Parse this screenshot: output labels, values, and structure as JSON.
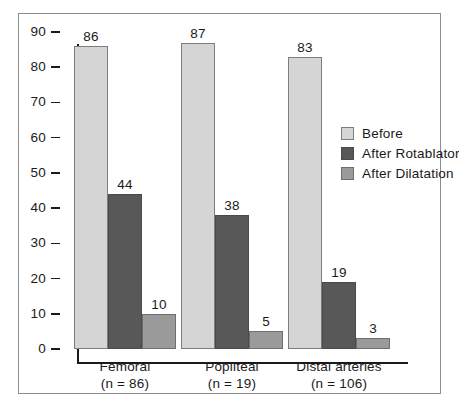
{
  "chart_data": {
    "type": "bar",
    "title": "",
    "subtitle": "",
    "xlabel": "",
    "ylabel": "",
    "ylim": [
      0,
      90
    ],
    "ytick_step": 10,
    "yticks": [
      90,
      80,
      70,
      60,
      50,
      40,
      30,
      20,
      10,
      0
    ],
    "grid": false,
    "legend_position": "right",
    "categories": [
      "Femoral",
      "Popliteal",
      "Distal arteries"
    ],
    "category_sublabels": [
      "(n = 86)",
      "(n = 19)",
      "(n = 106)"
    ],
    "series": [
      {
        "name": "Before",
        "values": [
          86,
          87,
          83
        ],
        "color": "#d5d5d5"
      },
      {
        "name": "After Rotablator",
        "values": [
          44,
          38,
          19
        ],
        "color": "#585858"
      },
      {
        "name": "After Dilatation",
        "values": [
          10,
          5,
          3
        ],
        "color": "#9a9a9a"
      }
    ]
  },
  "legend": {
    "items": [
      {
        "label": "Before",
        "swatch": "light"
      },
      {
        "label": "After Rotablator",
        "swatch": "dark"
      },
      {
        "label": "After Dilatation",
        "swatch": "medium"
      }
    ]
  },
  "axis": {
    "y_tick_labels": [
      "90",
      "80",
      "70",
      "60",
      "50",
      "40",
      "30",
      "20",
      "10",
      "0"
    ]
  },
  "groups": [
    {
      "name": "Femoral",
      "n_label": "(n = 86)",
      "bars": [
        {
          "series": "Before",
          "value": 86,
          "label": "86",
          "style": "light"
        },
        {
          "series": "After Rotablator",
          "value": 44,
          "label": "44",
          "style": "dark"
        },
        {
          "series": "After Dilatation",
          "value": 10,
          "label": "10",
          "style": "medium"
        }
      ]
    },
    {
      "name": "Popliteal",
      "n_label": "(n = 19)",
      "bars": [
        {
          "series": "Before",
          "value": 87,
          "label": "87",
          "style": "light"
        },
        {
          "series": "After Rotablator",
          "value": 38,
          "label": "38",
          "style": "dark"
        },
        {
          "series": "After Dilatation",
          "value": 5,
          "label": "5",
          "style": "medium"
        }
      ]
    },
    {
      "name": "Distal arteries",
      "n_label": "(n = 106)",
      "bars": [
        {
          "series": "Before",
          "value": 83,
          "label": "83",
          "style": "light"
        },
        {
          "series": "After Rotablator",
          "value": 19,
          "label": "19",
          "style": "dark"
        },
        {
          "series": "After Dilatation",
          "value": 3,
          "label": "3",
          "style": "medium"
        }
      ]
    }
  ],
  "colors": {
    "before": "#d5d5d5",
    "after_rotablator": "#585858",
    "after_dilatation": "#9a9a9a",
    "axis": "#1a1a1a",
    "frame": "#8d8d8d"
  }
}
